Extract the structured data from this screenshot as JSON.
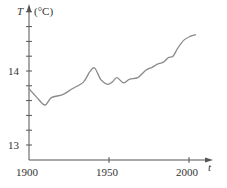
{
  "chart_data": {
    "type": "line",
    "title": "",
    "xlabel": "t",
    "ylabel": "T",
    "ylabel_unit": "(°C)",
    "xlim": [
      1900,
      2012
    ],
    "ylim": [
      12.9,
      14.9
    ],
    "x_ticks": [
      1900,
      1950,
      2000
    ],
    "x_tick_labels": [
      "1900",
      "1950",
      "2000"
    ],
    "y_ticks": [
      13,
      13.2,
      13.4,
      13.6,
      13.8,
      14,
      14.2,
      14.4,
      14.6,
      14.8
    ],
    "y_tick_labels": {
      "13": "13",
      "14": "14"
    },
    "grid": false,
    "legend": null,
    "series": [
      {
        "name": "Global average temperature",
        "color": "#8a8a8a",
        "x": [
          1900,
          1905,
          1910,
          1914,
          1921,
          1927,
          1934,
          1938,
          1941,
          1945,
          1949,
          1952,
          1955,
          1959,
          1963,
          1968,
          1973,
          1977,
          1980,
          1984,
          1987,
          1990,
          1993,
          1997,
          2001,
          2004
        ],
        "values": [
          13.76,
          13.64,
          13.54,
          13.64,
          13.68,
          13.76,
          13.85,
          13.99,
          14.04,
          13.88,
          13.82,
          13.85,
          13.91,
          13.84,
          13.89,
          13.91,
          14.01,
          14.05,
          14.09,
          14.12,
          14.18,
          14.2,
          14.31,
          14.42,
          14.47,
          14.49
        ]
      }
    ]
  },
  "labels": {
    "y_axis_var": "T",
    "y_axis_unit": "(°C)",
    "x_axis_var": "t",
    "y14": "14",
    "y13": "13",
    "x1900": "1900",
    "x1950": "1950",
    "x2000": "2000"
  },
  "colors": {
    "axis": "#555555",
    "curve": "#8a8a8a",
    "text": "#333333"
  }
}
